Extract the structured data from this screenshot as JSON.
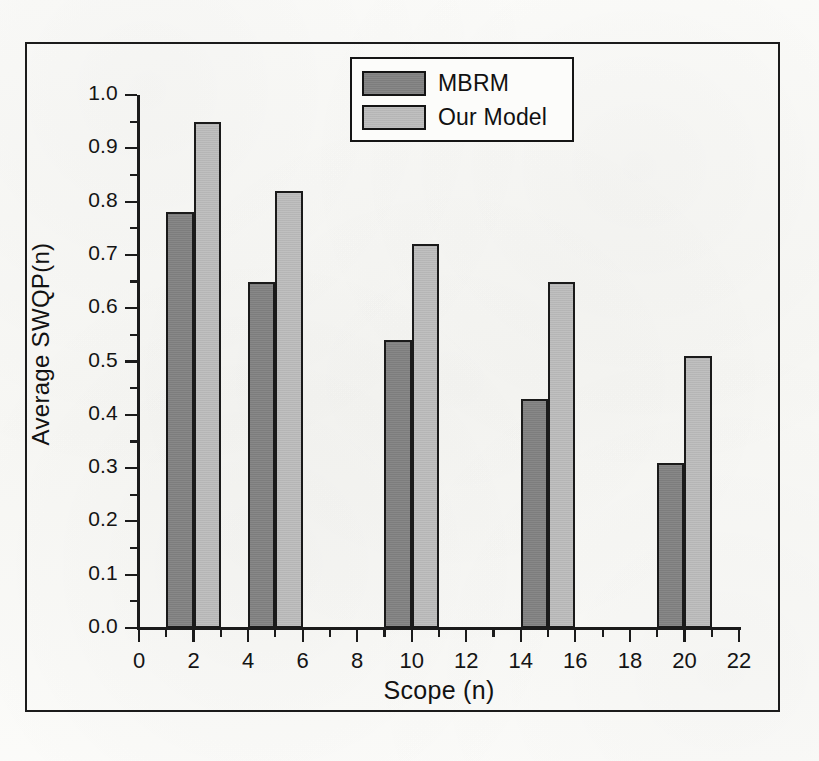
{
  "chart_data": {
    "type": "bar",
    "title": "",
    "subtitle": "",
    "xlabel": "Scope (n)",
    "ylabel": "Average SWQP(n)",
    "xlim": [
      0,
      22
    ],
    "ylim": [
      0.0,
      1.0
    ],
    "grid": false,
    "legend_position": "top-center",
    "x_major_step": 2,
    "x_minor_step": 1,
    "y_major_step": 0.1,
    "y_minor_step": 0.05,
    "x_tick_labels": [
      "0",
      "2",
      "4",
      "6",
      "8",
      "10",
      "12",
      "14",
      "16",
      "18",
      "20",
      "22"
    ],
    "x_tick_values": [
      0,
      2,
      4,
      6,
      8,
      10,
      12,
      14,
      16,
      18,
      20,
      22
    ],
    "y_tick_labels": [
      "0.0",
      "0.1",
      "0.2",
      "0.3",
      "0.4",
      "0.5",
      "0.6",
      "0.7",
      "0.8",
      "0.9",
      "1.0"
    ],
    "y_tick_values": [
      0.0,
      0.1,
      0.2,
      0.3,
      0.4,
      0.5,
      0.6,
      0.7,
      0.8,
      0.9,
      1.0
    ],
    "categories": [
      "5",
      "10",
      "15",
      "20",
      "25"
    ],
    "group_x_starts": [
      1,
      4,
      9,
      14,
      19
    ],
    "bar_width_units": 1,
    "series": [
      {
        "name": "MBRM",
        "color": "#828282",
        "edge_color": "#1a1a1a",
        "values": [
          0.78,
          0.65,
          0.54,
          0.43,
          0.31
        ]
      },
      {
        "name": "Our Model",
        "color": "#bcbcbc",
        "edge_color": "#1a1a1a",
        "values": [
          0.95,
          0.82,
          0.72,
          0.65,
          0.51
        ]
      }
    ]
  },
  "legend": {
    "entries": [
      {
        "label": "MBRM"
      },
      {
        "label": "Our Model"
      }
    ]
  },
  "axes": {
    "x_title": "Scope (n)",
    "y_title": "Average SWQP(n)"
  },
  "colors": {
    "series_dark": "#828282",
    "series_light": "#bcbcbc",
    "ink": "#1a1a1a",
    "paper": "#fbfbf9"
  }
}
